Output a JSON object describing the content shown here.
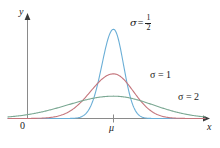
{
  "figure": {
    "background": "#ffffff",
    "axis_color": "#8a8a8a",
    "axis_text_color": "#222222"
  },
  "axes": {
    "y_label": "y",
    "x_label": "x",
    "origin_label": "0",
    "mu_tick_label": "μ"
  },
  "labels": {
    "sigma_half": {
      "symbol": "σ",
      "equals": "=",
      "numerator": "1",
      "denominator": "2"
    },
    "sigma_one": {
      "text": "σ = 1"
    },
    "sigma_two": {
      "text": "σ = 2"
    }
  },
  "chart_data": {
    "type": "line",
    "title": "",
    "xlabel": "x",
    "ylabel": "y",
    "grid": false,
    "legend": "inline-annotations",
    "x_ticks": [
      "0",
      "μ"
    ],
    "y_ticks": [],
    "series": [
      {
        "name": "σ = 1/2",
        "label": "σ = 1/2",
        "color": "#6aaed6",
        "sigma": 0.5,
        "mu": 0,
        "peak_height": 0.7979,
        "annotation_text": "σ = 1/2"
      },
      {
        "name": "σ = 1",
        "label": "σ = 1",
        "color": "#c4757c",
        "sigma": 1,
        "mu": 0,
        "peak_height": 0.3989,
        "annotation_text": "σ = 1"
      },
      {
        "name": "σ = 2",
        "label": "σ = 2",
        "color": "#7ba893",
        "sigma": 2,
        "mu": 0,
        "peak_height": 0.1995,
        "annotation_text": "σ = 2"
      }
    ],
    "xlim": [
      -4.6,
      4.6
    ],
    "ylim": [
      0,
      0.88
    ]
  }
}
